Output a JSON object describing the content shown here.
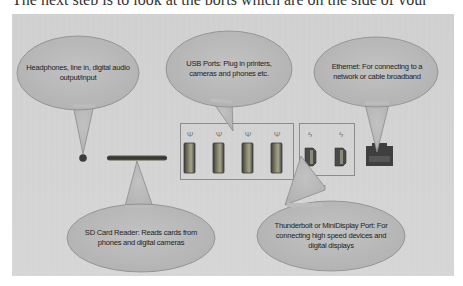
{
  "top_strip": {
    "text": "The next step is to look at the ports which are on the side of your"
  },
  "colors": {
    "panel_bg": "#d3d3d3",
    "bubble_fill": "#bababa",
    "bubble_stroke": "#8a8a8a",
    "port_dark": "#4a4a4a",
    "port_accent": "#6b6b50"
  },
  "callouts": [
    {
      "id": "headphones",
      "text": "Headphones, line in, digital audio output/input"
    },
    {
      "id": "usb",
      "text": "USB Ports: Plug in printers, cameras and phones etc."
    },
    {
      "id": "ethernet",
      "text": "Ethernet: For connecting to a network or cable broadband"
    },
    {
      "id": "sd",
      "text": "SD Card Reader: Reads cards from phones and digital cameras"
    },
    {
      "id": "thunderbolt",
      "text": "Thunderbolt or MiniDisplay Port: For connecting high speed devices and digital displays"
    }
  ],
  "ports": {
    "usb_count": 4,
    "usb_icon": "usb-trident-icon",
    "thunderbolt_count": 2,
    "thunderbolt_icon": "lightning-bolt-icon",
    "usb_glyph": "Ψ",
    "bolt_glyph": "ϟ"
  }
}
